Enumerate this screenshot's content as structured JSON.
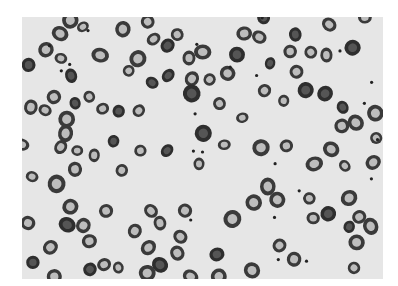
{
  "image": {
    "description": "Grayscale light micrograph of a peripheral blood smear showing numerous red blood cells (erythrocytes) with central pallor, some target/teardrop/irregular shapes, scattered small dark platelets",
    "background_color": "#ffffff",
    "field_color": "#e6e6e6",
    "cell_rim_color": "#3a3a3a",
    "cell_center_color": "#bdbdbd"
  }
}
